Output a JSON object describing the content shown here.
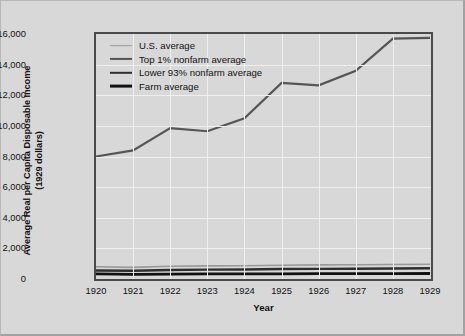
{
  "chart_data": {
    "type": "line",
    "title": "",
    "xlabel": "Year",
    "ylabel": "Average Real per Capita Disposable Income (1929 dollars)",
    "ylabel_line1": "Average Real per Capita Disposable Income",
    "ylabel_line2": "(1929 dollars)",
    "categories": [
      1920,
      1921,
      1922,
      1923,
      1924,
      1925,
      1926,
      1927,
      1928,
      1929
    ],
    "xtick_labels": [
      "1920",
      "1921",
      "1922",
      "1923",
      "1924",
      "1925",
      "1926",
      "1927",
      "1928",
      "1929"
    ],
    "ytick_labels": [
      "0",
      "2,000",
      "4,000",
      "6,000",
      "8,000",
      "10,000",
      "12,000",
      "14,000",
      "16,000"
    ],
    "ytick_values": [
      0,
      2000,
      4000,
      6000,
      8000,
      10000,
      12000,
      14000,
      16000
    ],
    "ylim": [
      0,
      16000
    ],
    "xlim": [
      1920,
      1929
    ],
    "grid": true,
    "legend_position": "upper-left",
    "series": [
      {
        "name": "U.S. average",
        "color": "#999999",
        "width": 1.6,
        "values": [
          800,
          760,
          830,
          860,
          870,
          900,
          920,
          930,
          950,
          960
        ]
      },
      {
        "name": "Top 1% nonfarm average",
        "color": "#555555",
        "width": 2.2,
        "values": [
          8000,
          8400,
          9850,
          9650,
          10500,
          12800,
          12650,
          13600,
          15700,
          15750
        ]
      },
      {
        "name": "Lower 93% nonfarm average",
        "color": "#2e2e2e",
        "width": 2.4,
        "values": [
          560,
          540,
          590,
          610,
          620,
          650,
          660,
          670,
          690,
          700
        ]
      },
      {
        "name": "Farm average",
        "color": "#111111",
        "width": 2.8,
        "values": [
          330,
          300,
          320,
          330,
          330,
          340,
          345,
          350,
          355,
          360
        ]
      }
    ]
  },
  "legend": {
    "items": [
      {
        "label": "U.S. average"
      },
      {
        "label": "Top 1% nonfarm average"
      },
      {
        "label": "Lower 93% nonfarm average"
      },
      {
        "label": "Farm average"
      }
    ]
  },
  "colors": {
    "background": "#d8d8d8",
    "axis": "#4a4a4a",
    "grid": "#efefef",
    "text": "#111111"
  }
}
